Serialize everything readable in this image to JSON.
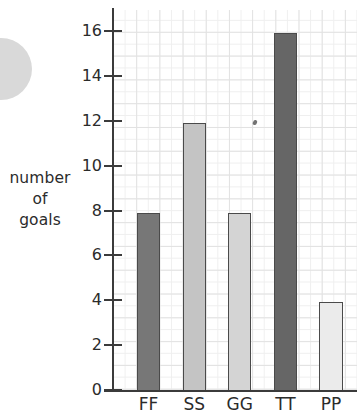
{
  "chart_data": {
    "type": "bar",
    "title": "",
    "xlabel": "",
    "ylabel": "number of goals",
    "ylabel_lines": [
      "number",
      "of",
      "goals"
    ],
    "categories": [
      "FF",
      "SS",
      "GG",
      "TT",
      "PP"
    ],
    "values": [
      8,
      12,
      8,
      16,
      4
    ],
    "ylim": [
      0,
      16
    ],
    "ytick_labels": [
      "0",
      "2",
      "4",
      "6",
      "8",
      "10",
      "12",
      "14",
      "16"
    ],
    "ytick_values": [
      0,
      2,
      4,
      6,
      8,
      10,
      12,
      14,
      16
    ],
    "minor_gridline_step": 1,
    "grid": true,
    "legend": "none",
    "bar_colors": [
      "#777777",
      "#c4c4c4",
      "#d4d4d4",
      "#666666",
      "#ebebeb"
    ],
    "bar_border_color": "#4a4a4a",
    "gridline_color": "#e2e2e2",
    "minor_gridline_color": "#efefef",
    "axis_color": "#3b3b3b",
    "text_color": "#2b2b2b",
    "background_color": "#ffffff",
    "decoration_color": "#d9d9d9"
  }
}
